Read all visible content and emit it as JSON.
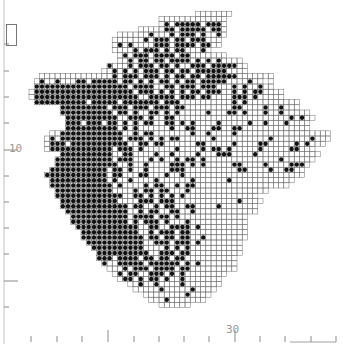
{
  "map": {
    "title": "",
    "grid": {
      "cell_px": 5.2,
      "origin_x": 3,
      "origin_y": 6,
      "legend": {
        ".": "outside",
        "o": "recorded-grid-square (no record)",
        "#": "record present (dot)"
      },
      "rows": [
        "..........................................................",
        ".....................................ooooooo..............",
        "..............................ooooooooooooo...............",
        "..............................o#o#####o###o...............",
        "..........................ooooo##o#####o##o...............",
        "......................oooooo#ooo#o###o#oo#o...............",
        ".....................oooooo#o###o##o###ooo................",
        ".....................o#o#oooo###o####o##oo................",
        ".....................oooo#o###o#o##ooo#o..................",
        "......................o#o###o####o##ooooooo...............",
        "......................oo#o##o##o####o#o#o#oooo............",
        "....................#ooo#o###o##o#oo###o#####oo...........",
        "...................oo#o#o#o###o##o##o######oooo...........",
        ".......oooooooooooooo#o###o###o#o##o##o######ooooooo......",
        "......o#oo#ooo##o#####o##o#o#o##o#o##o#####oooo#oo.o......",
        "......##################o####oo##o###o###ooo#o#oo#oo......",
        ".....o###################o###o#o#o#o##o###oo#o#o##oooo....",
        ".....o####################oo#####o###o##oooo###o#ooooo....",
        "......##########o#####o#######o###oooooooooo#o#oooooooooo.",
        "...........#########o###o###o###o##ooooooooo##oooo#oo#ooo.",
        "...........##########o##o#oo##o#o#ooooo#ooo##o#ooo#oo#ooooo",
        "............##########oo###o#oo##oooooooooooooooooooooo#o#oo",
        "............###o###o##o#o#o##oo##o#o#oooo#ooooo#oo#ooo#oooo..",
        "............##########o#o#oooooo#oo##ooo##oo##ooooooooooooo..",
        ".........oo############oo#o##ooooooo#oo#oooo#oooooooooooooooooo",
        "........o#o############o###o#o#o##oooooo#oooooooooo#ooooooo#ooo",
        "........o###o###########oo##o##oooooo##ooooo#oooo##ooooo#o#ooo.",
        "........o############o###o#oooooo#oooo#o##o#ooooo#ooooo##ooo...",
        "...........##########oo##oooo#oo#oooo#ooo###oooo#oooooooooooo..",
        "..........###########o###ooo#o#oo#o##o#oooooooooooooo#oooooo...",
        "..........############oo#oo#oooo###o#o#ooooo##oooo#oooo###o.....",
        ".........###########o##o#oo#oooo###oooooooooo##oooo#oo##oo......",
        "........############o##ooo##ooo#oo#ooooooooooooooooooooooo......",
        ".........###########o#oo#oooo#oooooo#oooooo#oooooooooooo........",
        ".........############o#oooo#o##oo#o##oooooooooooooooooo.........",
        "..........###########oooo#o##o##ooo#ooooooooooooooo.............",
        "..........#############oo##o#o#o#o#oooooooooooooo...............",
        "...........###########oooo###o###oooooooooooo#oooo..............",
        "...........#############o##oo#o##oo##oooo#ooooooo...............",
        "............############oo#o##oo##oo#oooooooooooo................",
        ".............###########o####o##o#ooooooooooooo.................",
        ".............###########o#o###o#ooo#ooooooooooo.................",
        "..............############oo##oo####o#ooooooooo.................",
        "...............###########oo#o###o##ooooooooooo.................",
        "...............############o##o##o##oo#oooooooo.................",
        "................###########oo###o###o#oooooooo..................",
        ".................##########oooo#o#o#oooooooooo..................",
        "..................##########oo###o##oooooooooo..................",
        "..................###o####o##o##o##oooooooooo...................",
        "...................#oo#####o######o#o#ooooooo...................",
        "....................ooo#o###o####o##ooooooooo...................",
        ".....................o#o##oo###o#o#oooooooo.....................",
        "......................o##o#o##o#oo#ooooooo......................",
        "........................oo#oo#oooo#ooooooo......................",
        ".........................ooooo#ooooo#oooo.......................",
        "...........................oooooooo#oooo........................",
        "............................ooo#ooooooo.........................",
        "..............................oooooo............................"
      ]
    },
    "axis": {
      "left_ticks_y": [
        44,
        71,
        97,
        123,
        150,
        176,
        202,
        228,
        254,
        281,
        307
      ],
      "left_major_y": [
        150,
        281
      ],
      "bottom_ticks_x": [
        31,
        57,
        82,
        108,
        134,
        159,
        184,
        209,
        235,
        260,
        285,
        311,
        336
      ],
      "bottom_major_x": [
        108,
        235
      ],
      "labels": [
        {
          "text": "10",
          "x": 9,
          "y": 142
        },
        {
          "text": "30",
          "x": 226,
          "y": 323
        }
      ]
    },
    "colors": {
      "dot": "#111111",
      "grid_line": "#6e6e6e",
      "axis": "#8a8a8a",
      "label": "#9a9a9a",
      "background": "#ffffff"
    }
  }
}
